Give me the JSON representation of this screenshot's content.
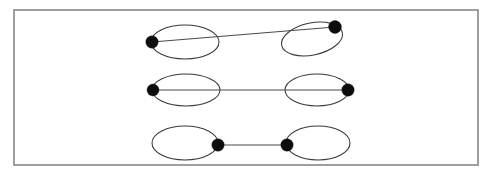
{
  "figure": {
    "canvas": {
      "width": 495,
      "height": 176
    },
    "background_color": "#ffffff",
    "frame": {
      "label": "figure-border",
      "x": 14,
      "y": 10,
      "width": 464,
      "height": 155,
      "stroke_color": "#888888",
      "stroke_width": 1.6,
      "fill_color": "#ffffff"
    },
    "style": {
      "ellipse_stroke_color": "#3a3a3a",
      "ellipse_stroke_width": 1.05,
      "edge_stroke_color": "#4a4a4a",
      "edge_stroke_width": 1.15,
      "vertex_fill_color": "#0d0d0d",
      "vertex_radius": 6.0
    },
    "rows": [
      {
        "name": "row-top",
        "index": 1,
        "description": "Edge slants upward from the left ellipse left vertex to the tilted right ellipse upper vertex",
        "ellipses": [
          {
            "name": "ellipse-top-left",
            "cx": 185,
            "cy": 42,
            "rx": 34,
            "ry": 17,
            "rotation": 0
          },
          {
            "name": "ellipse-top-right",
            "cx": 312,
            "cy": 39,
            "rx": 31,
            "ry": 16,
            "rotation": -12
          }
        ],
        "vertices": [
          {
            "name": "vertex-top-left",
            "cx": 152,
            "cy": 42,
            "r": 6.2
          },
          {
            "name": "vertex-top-right",
            "cx": 335,
            "cy": 27,
            "r": 6.4
          }
        ],
        "edge": {
          "name": "edge-top",
          "x1": 152,
          "y1": 42,
          "x2": 335,
          "y2": 27
        }
      },
      {
        "name": "row-middle",
        "index": 2,
        "description": "Horizontal edge from the far left vertex through both ellipses to the far right vertex",
        "ellipses": [
          {
            "name": "ellipse-middle-left",
            "cx": 186,
            "cy": 90,
            "rx": 34,
            "ry": 16,
            "rotation": 0
          },
          {
            "name": "ellipse-middle-right",
            "cx": 317,
            "cy": 90,
            "rx": 32,
            "ry": 16,
            "rotation": 0
          }
        ],
        "vertices": [
          {
            "name": "vertex-middle-left",
            "cx": 153,
            "cy": 90,
            "r": 6.0
          },
          {
            "name": "vertex-middle-right",
            "cx": 348,
            "cy": 90,
            "r": 6.2
          }
        ],
        "edge": {
          "name": "edge-middle",
          "x1": 153,
          "y1": 90,
          "x2": 348,
          "y2": 90
        }
      },
      {
        "name": "row-bottom",
        "index": 3,
        "description": "Short horizontal edge joining the inner vertices of the two ellipses",
        "ellipses": [
          {
            "name": "ellipse-bottom-left",
            "cx": 185,
            "cy": 143,
            "rx": 33,
            "ry": 17,
            "rotation": 0
          },
          {
            "name": "ellipse-bottom-right",
            "cx": 318,
            "cy": 143,
            "rx": 32,
            "ry": 17,
            "rotation": 0
          }
        ],
        "vertices": [
          {
            "name": "vertex-bottom-left",
            "cx": 218,
            "cy": 145,
            "r": 6.2
          },
          {
            "name": "vertex-bottom-right",
            "cx": 287,
            "cy": 145,
            "r": 6.2
          }
        ],
        "edge": {
          "name": "edge-bottom",
          "x1": 218,
          "y1": 145,
          "x2": 287,
          "y2": 145
        }
      }
    ]
  }
}
